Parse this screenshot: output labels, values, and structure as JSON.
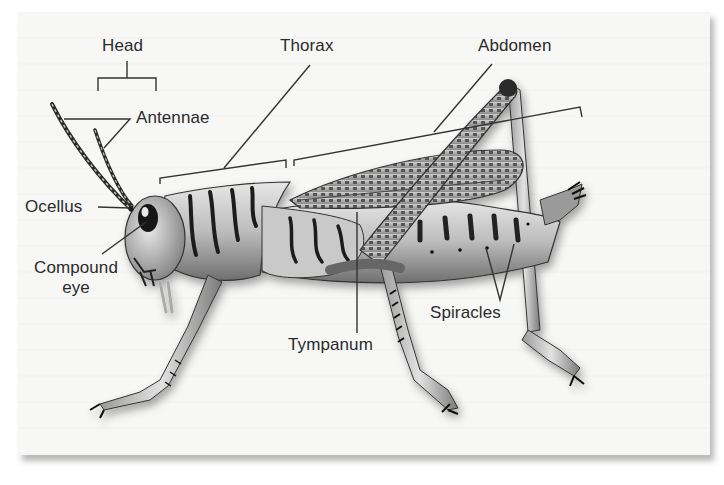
{
  "diagram": {
    "colors": {
      "panel": "#f7f7f6",
      "text": "#2b2b2b",
      "leader_line": "#333333",
      "body_light": "#d8d8d8",
      "body_dark": "#1e1e1e"
    },
    "labels": {
      "head": "Head",
      "thorax": "Thorax",
      "abdomen": "Abdomen",
      "antennae": "Antennae",
      "ocellus": "Ocellus",
      "compound_eye_line1": "Compound",
      "compound_eye_line2": "eye",
      "tympanum": "Tympanum",
      "spiracles": "Spiracles"
    }
  }
}
